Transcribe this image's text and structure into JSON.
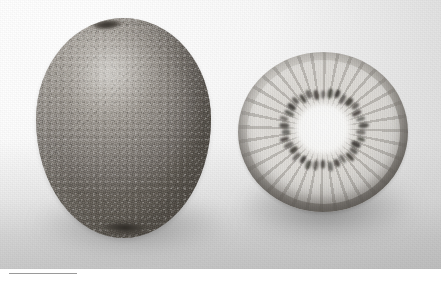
{
  "image": {
    "kind": "photograph",
    "palette": "grayscale",
    "subject": "kiwifruit",
    "background_color": "#fdfdfd",
    "plate_width": 441,
    "plate_height": 269
  },
  "photo": {
    "ground_label": "photo-backdrop",
    "grain_label": "film-grain-overlay",
    "shadow_whole_label": "cast-shadow-whole-fruit",
    "shadow_half_label": "cast-shadow-half-fruit"
  },
  "subjects": {
    "whole_fruit": {
      "label": "whole-kiwifruit",
      "skin_color": "#8f8a84",
      "skin_highlight_color": "#b9b5ae",
      "skin_shadow_color": "#656059",
      "stem_scar_color": "#34302b",
      "stem_top_label": "stem-scar-top",
      "stem_bottom_label": "stem-scar-bottom",
      "shape": "oval"
    },
    "half_fruit": {
      "label": "halved-kiwifruit",
      "flesh_color": "#e3e0db",
      "core_color": "#ffffff",
      "seed_color": "#3b3833",
      "skin_rim_color": "#4a4641",
      "seed_count": 34,
      "shape": "round cut face"
    }
  },
  "caption": {
    "rule_color": "#9a9a9a",
    "text": ""
  }
}
